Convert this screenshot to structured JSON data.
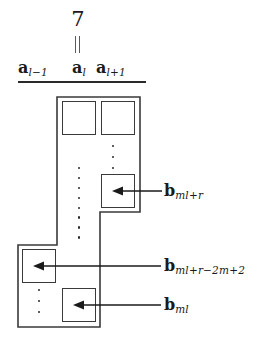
{
  "figure": {
    "name": "block-staircase-diagram",
    "background_color": "#ffffff",
    "line_color": "#3a3a3a",
    "text_color": "#1a1a1a"
  },
  "marker": {
    "value": "7",
    "stem_icon": "double-vertical-bar-icon"
  },
  "column_headers": [
    {
      "key": "a_l_minus_1",
      "base": "a",
      "subscript": "l−1"
    },
    {
      "key": "a_l",
      "base": "a",
      "subscript": "l"
    },
    {
      "key": "a_l_plus_1",
      "base": "a",
      "subscript": "l+1"
    }
  ],
  "cells": [
    {
      "key": "top_left",
      "row": 0,
      "column": "a_l",
      "label": ""
    },
    {
      "key": "top_right",
      "row": 0,
      "column": "a_l_plus_1",
      "label": ""
    },
    {
      "key": "b_ml_plus_r",
      "row": 2,
      "column": "a_l_plus_1",
      "label": ""
    },
    {
      "key": "b_ml_plus_r_m2m_p2",
      "row": 4,
      "column": "a_l_minus_1",
      "label": ""
    },
    {
      "key": "b_ml",
      "row": 5,
      "column": "a_l",
      "label": ""
    }
  ],
  "annotations": [
    {
      "key": "b_ml_plus_r",
      "base": "b",
      "subscript": "ml+r",
      "arrow_icon": "left-arrow-icon",
      "points_to": "b_ml_plus_r"
    },
    {
      "key": "b_ml_plus_r_m2m_p2",
      "base": "b",
      "subscript": "ml+r−2m+2",
      "arrow_icon": "left-arrow-icon",
      "points_to": "b_ml_plus_r_m2m_p2"
    },
    {
      "key": "b_ml",
      "base": "b",
      "subscript": "ml",
      "arrow_icon": "left-arrow-icon",
      "points_to": "b_ml"
    }
  ],
  "ellipses": [
    {
      "key": "dots_upper_right",
      "orientation": "vertical",
      "count": 3
    },
    {
      "key": "dots_mid_left",
      "orientation": "vertical",
      "count": 8
    },
    {
      "key": "dots_bottom_left",
      "orientation": "vertical",
      "count": 3
    }
  ]
}
